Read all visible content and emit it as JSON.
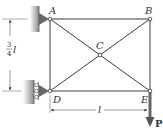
{
  "diagram": {
    "title": "",
    "nodes": [
      {
        "id": "A",
        "label": "A",
        "x": 50,
        "y": 19
      },
      {
        "id": "B",
        "label": "B",
        "x": 150,
        "y": 19
      },
      {
        "id": "C",
        "label": "C",
        "x": 100,
        "y": 55
      },
      {
        "id": "D",
        "label": "D",
        "x": 50,
        "y": 91
      },
      {
        "id": "E",
        "label": "E",
        "x": 150,
        "y": 91
      }
    ],
    "members": [
      "AB",
      "AD",
      "BE",
      "DE",
      "AC",
      "CE",
      "BC",
      "CD"
    ],
    "supports": {
      "A": "pin support (wall, left)",
      "D": "roller support (wall, left)"
    },
    "load": {
      "label": "P",
      "node": "E",
      "direction": "down"
    },
    "dimensions": {
      "height": {
        "num": "3",
        "den": "4",
        "var": "l"
      },
      "width": {
        "var": "l"
      }
    },
    "colors": {
      "line": "#3a3a3a",
      "load_arrow": "#555555",
      "wall": "#9a9a9a"
    }
  }
}
